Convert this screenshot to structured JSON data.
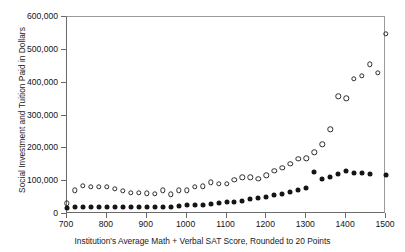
{
  "chart_data": {
    "type": "scatter",
    "title": "",
    "xlabel": "Institution's Average Math + Verbal SAT Score, Rounded to 20 Points",
    "ylabel": "Social Investment and Tuition Paid in Dollars",
    "xlim": [
      700,
      1500
    ],
    "ylim": [
      0,
      600000
    ],
    "xticks": [
      700,
      800,
      900,
      1000,
      1100,
      1200,
      1300,
      1400,
      1500
    ],
    "xtick_labels": [
      "700",
      "800",
      "900",
      "1000",
      "1100",
      "1200",
      "1300",
      "1400",
      "1500"
    ],
    "yticks": [
      0,
      100000,
      200000,
      300000,
      400000,
      500000,
      600000
    ],
    "ytick_labels": [
      "0",
      "100,000",
      "200,000",
      "300,000",
      "400,000",
      "500,000",
      "600,000"
    ],
    "grid": false,
    "legend": "none",
    "series": [
      {
        "name": "Social Investment",
        "marker": "open-circle",
        "color": "#2b2b2b",
        "points": [
          [
            700,
            33000
          ],
          [
            720,
            72000
          ],
          [
            740,
            85000
          ],
          [
            760,
            82000
          ],
          [
            780,
            83000
          ],
          [
            800,
            83000
          ],
          [
            820,
            77000
          ],
          [
            840,
            70000
          ],
          [
            860,
            65000
          ],
          [
            880,
            64000
          ],
          [
            900,
            63000
          ],
          [
            920,
            62000
          ],
          [
            940,
            72000
          ],
          [
            960,
            60000
          ],
          [
            980,
            72000
          ],
          [
            1000,
            72000
          ],
          [
            1020,
            82000
          ],
          [
            1040,
            84000
          ],
          [
            1060,
            96000
          ],
          [
            1080,
            92000
          ],
          [
            1100,
            92000
          ],
          [
            1120,
            104000
          ],
          [
            1140,
            112000
          ],
          [
            1160,
            112000
          ],
          [
            1180,
            108000
          ],
          [
            1200,
            118000
          ],
          [
            1220,
            132000
          ],
          [
            1240,
            140000
          ],
          [
            1260,
            152000
          ],
          [
            1280,
            168000
          ],
          [
            1300,
            170000
          ],
          [
            1320,
            188000
          ],
          [
            1340,
            212000
          ],
          [
            1360,
            258000
          ],
          [
            1380,
            358000
          ],
          [
            1400,
            352000
          ],
          [
            1420,
            412000
          ],
          [
            1440,
            420000
          ],
          [
            1460,
            456000
          ],
          [
            1480,
            430000
          ],
          [
            1500,
            548000
          ]
        ]
      },
      {
        "name": "Tuition Paid",
        "marker": "filled-circle",
        "color": "#151515",
        "points": [
          [
            700,
            18000
          ],
          [
            720,
            22000
          ],
          [
            740,
            22000
          ],
          [
            760,
            22000
          ],
          [
            780,
            22000
          ],
          [
            800,
            22000
          ],
          [
            820,
            22000
          ],
          [
            840,
            22000
          ],
          [
            860,
            22000
          ],
          [
            880,
            21000
          ],
          [
            900,
            21000
          ],
          [
            920,
            21000
          ],
          [
            940,
            22000
          ],
          [
            960,
            22000
          ],
          [
            980,
            24000
          ],
          [
            1000,
            26000
          ],
          [
            1020,
            27000
          ],
          [
            1040,
            28000
          ],
          [
            1060,
            31000
          ],
          [
            1080,
            34000
          ],
          [
            1100,
            36000
          ],
          [
            1120,
            38000
          ],
          [
            1140,
            41000
          ],
          [
            1160,
            45000
          ],
          [
            1180,
            48000
          ],
          [
            1200,
            52000
          ],
          [
            1220,
            58000
          ],
          [
            1240,
            62000
          ],
          [
            1260,
            68000
          ],
          [
            1280,
            74000
          ],
          [
            1300,
            80000
          ],
          [
            1320,
            128000
          ],
          [
            1340,
            108000
          ],
          [
            1360,
            112000
          ],
          [
            1380,
            122000
          ],
          [
            1400,
            130000
          ],
          [
            1420,
            124000
          ],
          [
            1440,
            124000
          ],
          [
            1460,
            122000
          ],
          [
            1500,
            120000
          ]
        ]
      }
    ]
  }
}
